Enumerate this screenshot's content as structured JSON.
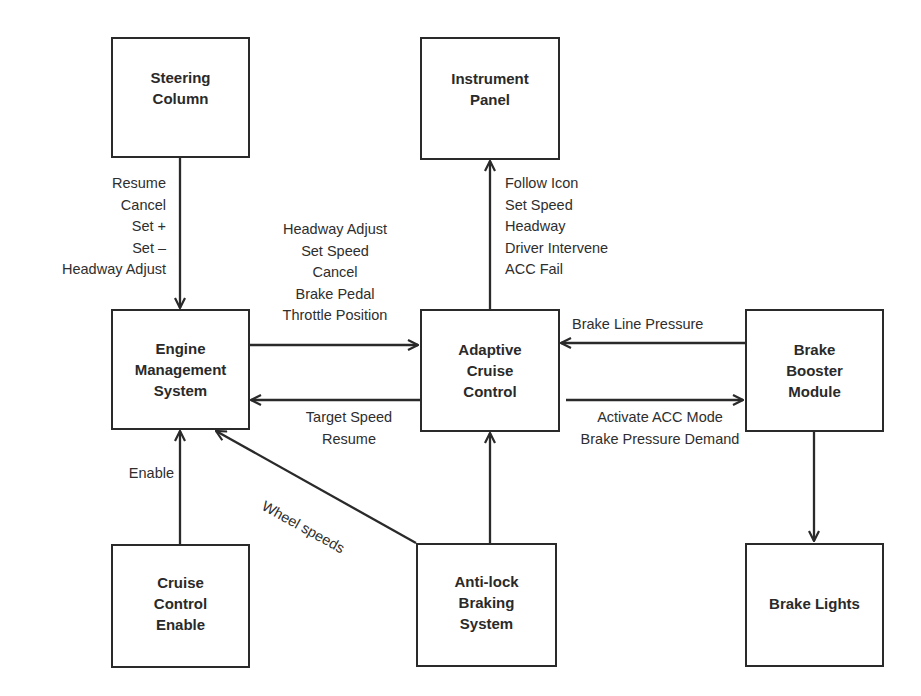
{
  "diagram": {
    "type": "block-diagram",
    "line_color": "#2a2a2a",
    "nodes": [
      {
        "id": "steering_column",
        "label": "Steering\nColumn"
      },
      {
        "id": "instrument_panel",
        "label": "Instrument\nPanel"
      },
      {
        "id": "engine_management",
        "label": "Engine\nManagement\nSystem"
      },
      {
        "id": "adaptive_cruise",
        "label": "Adaptive\nCruise\nControl"
      },
      {
        "id": "brake_booster",
        "label": "Brake\nBooster\nModule"
      },
      {
        "id": "cruise_enable",
        "label": "Cruise\nControl\nEnable"
      },
      {
        "id": "abs",
        "label": "Anti-lock\nBraking\nSystem"
      },
      {
        "id": "brake_lights",
        "label": "Brake Lights"
      }
    ],
    "edges": [
      {
        "from": "steering_column",
        "to": "engine_management",
        "label": "Resume\nCancel\nSet +\nSet –\nHeadway Adjust"
      },
      {
        "from": "engine_management",
        "to": "adaptive_cruise",
        "label": "Headway Adjust\nSet Speed\nCancel\nBrake Pedal\nThrottle Position"
      },
      {
        "from": "adaptive_cruise",
        "to": "instrument_panel",
        "label": "Follow Icon\nSet Speed\nHeadway\nDriver Intervene\nACC Fail"
      },
      {
        "from": "brake_booster",
        "to": "adaptive_cruise",
        "label": "Brake Line Pressure"
      },
      {
        "from": "adaptive_cruise",
        "to": "engine_management",
        "label": "Target Speed\nResume"
      },
      {
        "from": "adaptive_cruise",
        "to": "brake_booster",
        "label": "Activate ACC Mode\nBrake Pressure Demand"
      },
      {
        "from": "cruise_enable",
        "to": "engine_management",
        "label": "Enable"
      },
      {
        "from": "abs",
        "to": "engine_management",
        "label": "Wheel speeds"
      },
      {
        "from": "abs",
        "to": "adaptive_cruise",
        "label": ""
      },
      {
        "from": "brake_booster",
        "to": "brake_lights",
        "label": ""
      }
    ]
  }
}
